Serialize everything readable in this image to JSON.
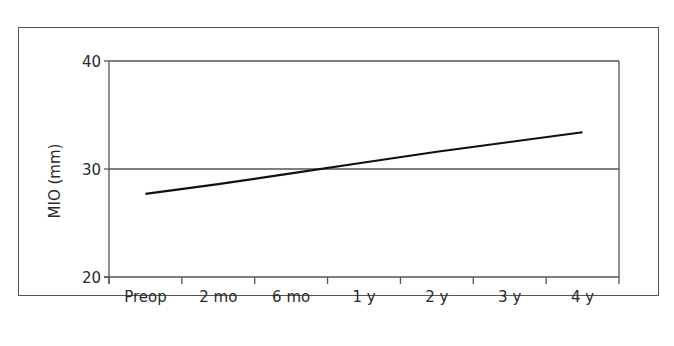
{
  "chart_data": {
    "type": "line",
    "title": "",
    "xlabel": "",
    "ylabel": "MIO (mm)",
    "categories": [
      "Preop",
      "2 mo",
      "6 mo",
      "1 y",
      "2 y",
      "3 y",
      "4 y"
    ],
    "series": [
      {
        "name": "MIO",
        "values": [
          27.7,
          28.6,
          29.6,
          30.6,
          31.6,
          32.5,
          33.4
        ]
      }
    ],
    "ylim": [
      20,
      40
    ],
    "yticks": [
      20,
      30,
      40
    ],
    "gridlines": [
      30
    ],
    "legend": null,
    "line_color": "#111111",
    "axis_color": "#555555"
  }
}
